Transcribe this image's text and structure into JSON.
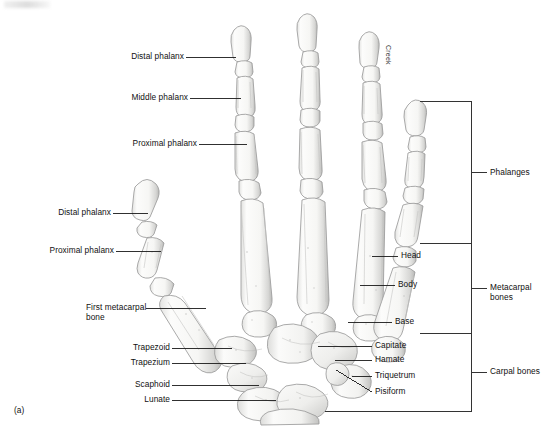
{
  "figure": {
    "panel_label": "(a)",
    "artist_signature": "Creek"
  },
  "left_labels": [
    {
      "text": "Distal phalanx",
      "name": "label-distal-phalanx-finger"
    },
    {
      "text": "Middle phalanx",
      "name": "label-middle-phalanx-finger"
    },
    {
      "text": "Proximal phalanx",
      "name": "label-proximal-phalanx-finger"
    },
    {
      "text": "Distal phalanx",
      "name": "label-distal-phalanx-thumb"
    },
    {
      "text": "Proximal phalanx",
      "name": "label-proximal-phalanx-thumb"
    },
    {
      "text": "First metacarpal bone",
      "name": "label-first-metacarpal-bone"
    },
    {
      "text": "Trapezoid",
      "name": "label-trapezoid"
    },
    {
      "text": "Trapezium",
      "name": "label-trapezium"
    },
    {
      "text": "Scaphoid",
      "name": "label-scaphoid"
    },
    {
      "text": "Lunate",
      "name": "label-lunate"
    }
  ],
  "right_labels": [
    {
      "text": "Head",
      "name": "label-head"
    },
    {
      "text": "Body",
      "name": "label-body"
    },
    {
      "text": "Base",
      "name": "label-base"
    },
    {
      "text": "Capitate",
      "name": "label-capitate"
    },
    {
      "text": "Hamate",
      "name": "label-hamate"
    },
    {
      "text": "Triquetrum",
      "name": "label-triquetrum"
    },
    {
      "text": "Pisiform",
      "name": "label-pisiform"
    }
  ],
  "brackets": [
    {
      "text": "Phalanges",
      "name": "bracket-label-phalanges"
    },
    {
      "text": "Metacarpal bones",
      "name": "bracket-label-metacarpal-bones"
    },
    {
      "text": "Carpal bones",
      "name": "bracket-label-carpal-bones"
    }
  ],
  "colors": {
    "bone_fill": "#fbfbfa",
    "bone_outline": "#9a9a9a",
    "bone_shadow": "#cdcdcd",
    "leader_line": "#1a1a1a",
    "bracket_line": "#333333",
    "text": "#111111",
    "background": "#ffffff"
  }
}
